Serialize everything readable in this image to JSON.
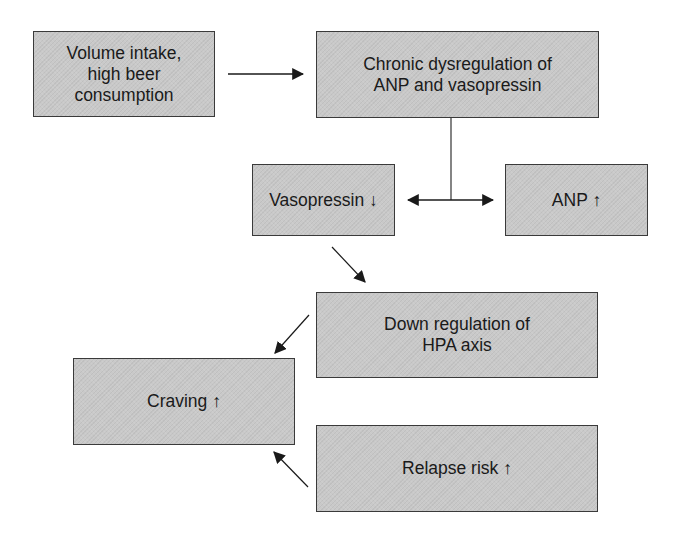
{
  "diagram": {
    "colors": {
      "box_fill": "#c9c9c9",
      "box_border": "#3a3a3a",
      "arrow": "#1a1a1a",
      "text": "#1a1a1a"
    },
    "nodes": {
      "volume_intake": {
        "label": "Volume intake,\nhigh beer\nconsumption"
      },
      "chronic_dysregulation": {
        "label": "Chronic dysregulation of\nANP and vasopressin"
      },
      "vasopressin": {
        "label": "Vasopressin ↓"
      },
      "anp": {
        "label": "ANP ↑"
      },
      "down_regulation": {
        "label": "Down regulation of\nHPA axis"
      },
      "craving": {
        "label": "Craving ↑"
      },
      "relapse_risk": {
        "label": "Relapse risk ↑"
      }
    },
    "edges": [
      {
        "from": "volume_intake",
        "to": "chronic_dysregulation"
      },
      {
        "from": "chronic_dysregulation",
        "to": "vasopressin"
      },
      {
        "from": "chronic_dysregulation",
        "to": "anp"
      },
      {
        "from": "vasopressin",
        "to": "down_regulation"
      },
      {
        "from": "down_regulation",
        "to": "craving"
      },
      {
        "from": "relapse_risk",
        "to": "craving"
      }
    ]
  }
}
